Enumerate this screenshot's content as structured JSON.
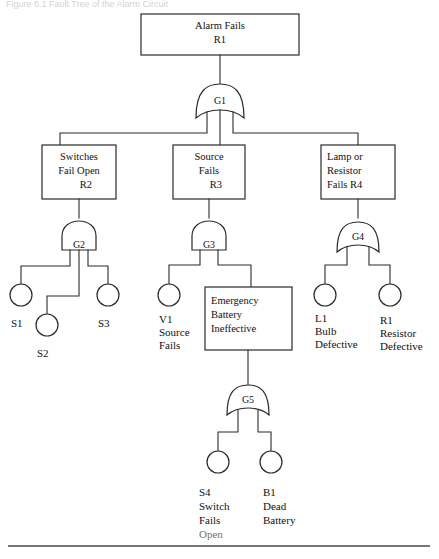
{
  "figure": {
    "caption_fragment": "Figure 6.1  Fault Tree of the Alarm Circuit",
    "rule_visible": true
  },
  "tree": {
    "top_event": {
      "id": "R1-top",
      "lines": [
        "Alarm Fails",
        "R1"
      ]
    },
    "gates": [
      {
        "id": "G1",
        "label": "G1",
        "type": "or",
        "inputs": 3
      },
      {
        "id": "G2",
        "label": "G2",
        "type": "and",
        "inputs": 3
      },
      {
        "id": "G3",
        "label": "G3",
        "type": "and",
        "inputs": 2
      },
      {
        "id": "G4",
        "label": "G4",
        "type": "or",
        "inputs": 2
      },
      {
        "id": "G5",
        "label": "G5",
        "type": "or",
        "inputs": 2
      }
    ],
    "intermediate_events": [
      {
        "id": "R2",
        "lines": [
          "Switches",
          "Fail Open",
          "R2"
        ],
        "align": "center"
      },
      {
        "id": "R3",
        "lines": [
          "Source",
          "Fails",
          "R3"
        ],
        "align": "center"
      },
      {
        "id": "R4",
        "lines": [
          "Lamp or",
          "Resistor",
          "Fails    R4"
        ],
        "align": "left"
      },
      {
        "id": "EB",
        "lines": [
          "Emergency",
          "Battery",
          "Ineffective"
        ],
        "align": "left"
      }
    ],
    "basic_events": [
      {
        "id": "S1",
        "lines": [
          "S1"
        ]
      },
      {
        "id": "S2",
        "lines": [
          "S2"
        ]
      },
      {
        "id": "S3",
        "lines": [
          "S3"
        ]
      },
      {
        "id": "V1",
        "lines": [
          "V1",
          "Source",
          "Fails"
        ]
      },
      {
        "id": "L1",
        "lines": [
          "L1",
          "Bulb",
          "Defective"
        ]
      },
      {
        "id": "R1b",
        "lines": [
          "R1",
          "Resistor",
          "Defective"
        ]
      },
      {
        "id": "S4",
        "lines": [
          "S4",
          "Switch",
          "Fails",
          "Open"
        ]
      },
      {
        "id": "B1",
        "lines": [
          "B1",
          "Dead",
          "Battery"
        ]
      }
    ]
  },
  "colors": {
    "ink": "#2a2a2a",
    "text": "#111111",
    "page": "#ffffff",
    "rule": "#4a4a4a"
  }
}
